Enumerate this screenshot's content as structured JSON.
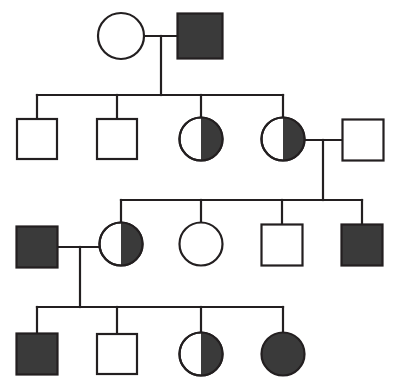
{
  "figure": {
    "type": "pedigree",
    "width": 396,
    "height": 390,
    "background_color": "#ffffff",
    "line_color": "#231f20",
    "fill_color": "#3a3a3a",
    "unaffected_fill": "#ffffff",
    "line_width": 2.2,
    "symbol_size": 42,
    "legend_note": "Squares = male, Circles = female, Filled = affected, Half-filled = carrier"
  },
  "chart_data": {
    "type": "diagram",
    "generations": [
      {
        "id": "I",
        "label": "Generation I",
        "y": 36,
        "individuals": [
          {
            "id": "I-1",
            "sex": "female",
            "shape": "circle",
            "status": "unaffected",
            "fill": "none",
            "cx": 121,
            "cy": 36,
            "size": 46
          },
          {
            "id": "I-2",
            "sex": "male",
            "shape": "square",
            "status": "affected",
            "fill": "full",
            "cx": 200,
            "cy": 36,
            "size": 45
          }
        ],
        "mating_lines": [
          {
            "id": "mate-I",
            "x1": 144,
            "y1": 36,
            "x2": 178,
            "y2": 36
          }
        ],
        "descent": [
          {
            "id": "descent-I",
            "x": 161,
            "y1": 36,
            "y2": 95
          }
        ]
      },
      {
        "id": "II",
        "label": "Generation II",
        "y": 139,
        "sibship_line": {
          "id": "sibship-II",
          "x1": 37,
          "x2": 283,
          "y": 95
        },
        "individuals": [
          {
            "id": "II-1",
            "sex": "male",
            "shape": "square",
            "status": "unaffected",
            "fill": "none",
            "cx": 37,
            "cy": 139,
            "size": 40
          },
          {
            "id": "II-2",
            "sex": "male",
            "shape": "square",
            "status": "unaffected",
            "fill": "none",
            "cx": 117,
            "cy": 139,
            "size": 40
          },
          {
            "id": "II-3",
            "sex": "female",
            "shape": "circle",
            "status": "carrier",
            "fill": "right-half",
            "cx": 201,
            "cy": 139,
            "size": 43
          },
          {
            "id": "II-4",
            "sex": "female",
            "shape": "circle",
            "status": "carrier",
            "fill": "right-half",
            "cx": 283,
            "cy": 139,
            "size": 43
          },
          {
            "id": "II-5",
            "sex": "male",
            "shape": "square",
            "status": "unaffected",
            "fill": "none",
            "cx": 363,
            "cy": 140,
            "size": 41
          }
        ],
        "drop_lines": [
          {
            "id": "drop-II-1",
            "x": 37,
            "y1": 95,
            "y2": 119
          },
          {
            "id": "drop-II-2",
            "x": 117,
            "y1": 95,
            "y2": 119
          },
          {
            "id": "drop-II-3",
            "x": 201,
            "y1": 95,
            "y2": 118
          },
          {
            "id": "drop-II-4",
            "x": 283,
            "y1": 95,
            "y2": 118
          }
        ],
        "mating_lines": [
          {
            "id": "mate-II",
            "x1": 305,
            "y1": 140,
            "x2": 342,
            "y2": 140
          }
        ],
        "descent": [
          {
            "id": "descent-II",
            "x": 323,
            "y1": 140,
            "y2": 200
          }
        ]
      },
      {
        "id": "III",
        "label": "Generation III",
        "y": 245,
        "sibship_line": {
          "id": "sibship-III",
          "x1": 121,
          "x2": 362,
          "y": 200
        },
        "individuals": [
          {
            "id": "III-1",
            "sex": "male",
            "shape": "square",
            "status": "affected",
            "fill": "full",
            "cx": 37,
            "cy": 247,
            "size": 41
          },
          {
            "id": "III-2",
            "sex": "female",
            "shape": "circle",
            "status": "carrier",
            "fill": "right-half",
            "cx": 121,
            "cy": 244,
            "size": 43
          },
          {
            "id": "III-3",
            "sex": "female",
            "shape": "circle",
            "status": "unaffected",
            "fill": "none",
            "cx": 201,
            "cy": 244,
            "size": 43
          },
          {
            "id": "III-4",
            "sex": "male",
            "shape": "square",
            "status": "unaffected",
            "fill": "none",
            "cx": 282,
            "cy": 245,
            "size": 41
          },
          {
            "id": "III-5",
            "sex": "male",
            "shape": "square",
            "status": "affected",
            "fill": "full",
            "cx": 362,
            "cy": 245,
            "size": 41
          }
        ],
        "drop_lines": [
          {
            "id": "drop-III-2",
            "x": 121,
            "y1": 200,
            "y2": 223
          },
          {
            "id": "drop-III-3",
            "x": 201,
            "y1": 200,
            "y2": 223
          },
          {
            "id": "drop-III-4",
            "x": 282,
            "y1": 200,
            "y2": 225
          },
          {
            "id": "drop-III-5",
            "x": 362,
            "y1": 200,
            "y2": 225
          }
        ],
        "mating_lines": [
          {
            "id": "mate-III",
            "x1": 58,
            "y1": 247,
            "x2": 100,
            "y2": 247
          }
        ],
        "descent": [
          {
            "id": "descent-III",
            "x": 80,
            "y1": 247,
            "y2": 307
          }
        ]
      },
      {
        "id": "IV",
        "label": "Generation IV",
        "y": 354,
        "sibship_line": {
          "id": "sibship-IV",
          "x1": 37,
          "x2": 283,
          "y": 307
        },
        "individuals": [
          {
            "id": "IV-1",
            "sex": "male",
            "shape": "square",
            "status": "affected",
            "fill": "full",
            "cx": 37,
            "cy": 354,
            "size": 41
          },
          {
            "id": "IV-2",
            "sex": "male",
            "shape": "square",
            "status": "unaffected",
            "fill": "none",
            "cx": 117,
            "cy": 354,
            "size": 40
          },
          {
            "id": "IV-3",
            "sex": "female",
            "shape": "circle",
            "status": "carrier",
            "fill": "right-half",
            "cx": 201,
            "cy": 354,
            "size": 43
          },
          {
            "id": "IV-4",
            "sex": "female",
            "shape": "circle",
            "status": "affected",
            "fill": "full",
            "cx": 283,
            "cy": 354,
            "size": 43
          }
        ],
        "drop_lines": [
          {
            "id": "drop-IV-1",
            "x": 37,
            "y1": 307,
            "y2": 334
          },
          {
            "id": "drop-IV-2",
            "x": 117,
            "y1": 307,
            "y2": 334
          },
          {
            "id": "drop-IV-3",
            "x": 201,
            "y1": 307,
            "y2": 333
          },
          {
            "id": "drop-IV-4",
            "x": 283,
            "y1": 307,
            "y2": 333
          }
        ],
        "mating_lines": [],
        "descent": []
      }
    ]
  }
}
